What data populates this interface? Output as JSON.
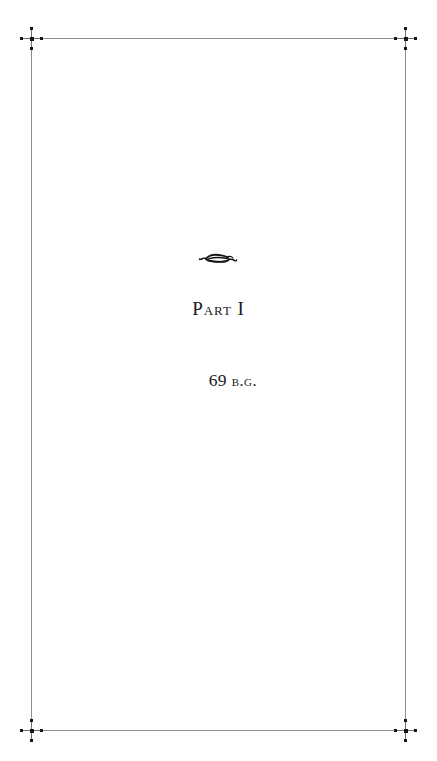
{
  "page": {
    "kind": "book-part-title-page",
    "background_color": "#ffffff",
    "text_color": "#1b1b20"
  },
  "border": {
    "rule_color": "#8e8e90",
    "corner_mark_color": "#16161a",
    "corners": [
      {
        "name": "top-left"
      },
      {
        "name": "top-right"
      },
      {
        "name": "bottom-left"
      },
      {
        "name": "bottom-right"
      }
    ]
  },
  "content": {
    "ornament": "horizontal-flourish-ornament",
    "part_label": "Part I",
    "date_number": "69",
    "date_era": "b.g."
  }
}
